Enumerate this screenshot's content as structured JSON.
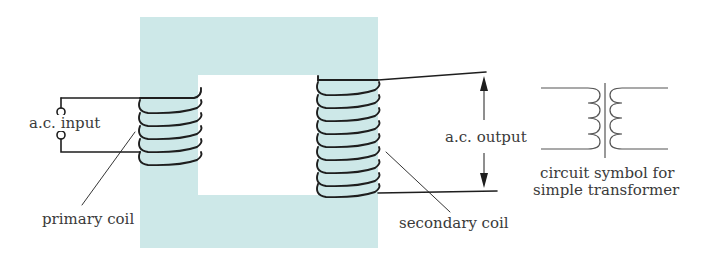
{
  "diagram": {
    "title": "Transformer",
    "core_color": "#cde8e8",
    "labels": {
      "input": "a.c. input",
      "primary": "primary coil",
      "output": "a.c. output",
      "secondary": "secondary coil",
      "symbol_line1": "circuit symbol for",
      "symbol_line2": "simple transformer"
    },
    "primary_turns": 5,
    "secondary_turns": 9
  }
}
